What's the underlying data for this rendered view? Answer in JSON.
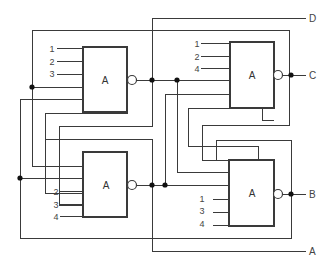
{
  "diagram": {
    "type": "logic-circuit",
    "gates": [
      {
        "id": "top-left",
        "label": "A",
        "inputs": [
          "1",
          "2",
          "3"
        ]
      },
      {
        "id": "top-right",
        "label": "A",
        "inputs": [
          "1",
          "2",
          "4"
        ],
        "output": "C"
      },
      {
        "id": "bottom-left",
        "label": "A",
        "inputs": [
          "2",
          "3",
          "4"
        ]
      },
      {
        "id": "bottom-right",
        "label": "A",
        "inputs": [
          "1",
          "3",
          "4"
        ],
        "output": "B"
      }
    ],
    "outputs": {
      "D": "D",
      "C": "C",
      "B": "B",
      "A": "A"
    },
    "colors": {
      "line": "#3a3a3a",
      "dot": "#111111",
      "background": "#ffffff"
    }
  }
}
